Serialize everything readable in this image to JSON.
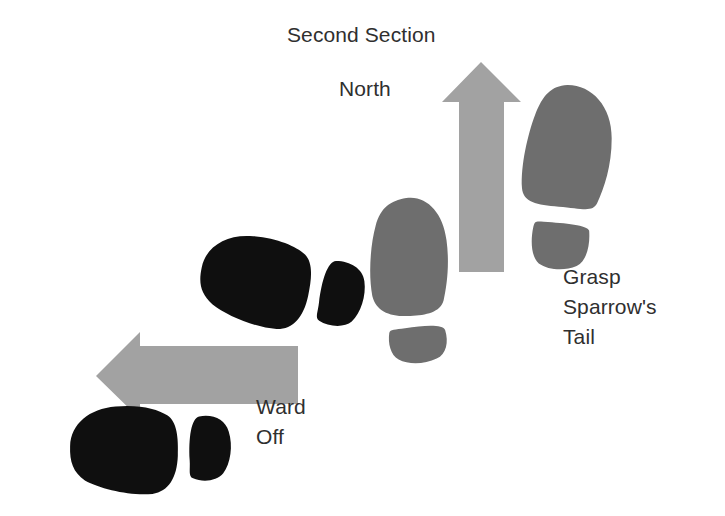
{
  "diagram": {
    "title": "Second Section",
    "orientation_label": "North",
    "background_color": "#ffffff",
    "text_color": "#2f2f2f",
    "arrow_color": "#a2a2a2",
    "gray_footprint_color": "#6e6e6e",
    "black_footprint_color": "#0f0f0f",
    "labels": [
      {
        "id": "second-section",
        "text": "Second Section"
      },
      {
        "id": "north",
        "text": "North"
      },
      {
        "id": "grasp-sparrows-tail",
        "text": "Grasp\nSparrow's\nTail"
      },
      {
        "id": "ward-off",
        "text": "Ward\nOff"
      }
    ],
    "arrows": [
      {
        "id": "north-arrow",
        "direction": "up",
        "color": "#a2a2a2"
      },
      {
        "id": "west-arrow",
        "direction": "left",
        "color": "#a2a2a2"
      }
    ],
    "footprints": [
      {
        "id": "gray-right-foot",
        "color": "#6e6e6e",
        "side": "right",
        "heading": "north"
      },
      {
        "id": "gray-left-foot",
        "color": "#6e6e6e",
        "side": "left",
        "heading": "north"
      },
      {
        "id": "black-upper-foot",
        "color": "#0f0f0f",
        "side": "left",
        "heading": "west"
      },
      {
        "id": "black-lower-foot",
        "color": "#0f0f0f",
        "side": "left",
        "heading": "west"
      }
    ]
  }
}
